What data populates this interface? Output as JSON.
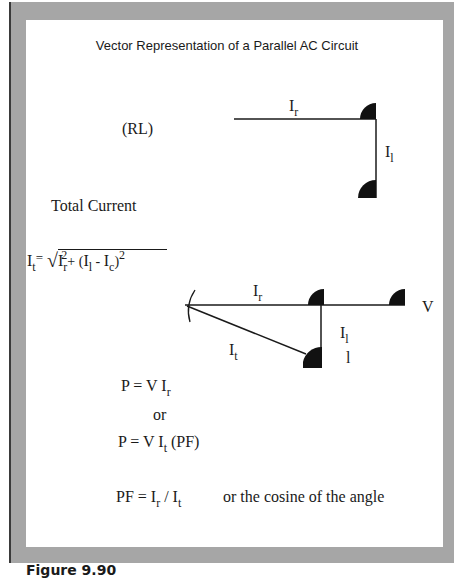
{
  "figure": {
    "title": "Vector Representation of a Parallel AC Circuit",
    "caption": "Figure 9.90"
  },
  "rl_diagram": {
    "label": "(RL)",
    "vectors": [
      {
        "name": "Ir",
        "label_main": "I",
        "label_sub": "r",
        "direction": "horizontal"
      },
      {
        "name": "Il",
        "label_main": "I",
        "label_sub": "l",
        "direction": "vertical-down"
      }
    ]
  },
  "total_current": {
    "heading": "Total Current",
    "formula": {
      "lhs_main": "I",
      "lhs_sub": "t",
      "equals": "=",
      "radical": "√",
      "term1_main": "I",
      "term1_sub": "r",
      "term1_sup": "2",
      "plus": "+ (",
      "term2_main": "I",
      "term2_sub": "l",
      "minus": " - ",
      "term3_main": "I",
      "term3_sub": "c",
      "close": ")",
      "close_sup": "2"
    }
  },
  "phasor_diagram": {
    "ir_main": "I",
    "ir_sub": "r",
    "it_main": "I",
    "it_sub": "t",
    "il_main": "I",
    "il_sub": "l",
    "il_extra": "l",
    "v_label": "V"
  },
  "power": {
    "eq1": {
      "lhs": "P = V ",
      "main": "I",
      "sub": "r"
    },
    "or": "or",
    "eq2": {
      "lhs": "P = V ",
      "main": "I",
      "sub": "t",
      "suffix": " (PF)"
    },
    "pf": {
      "lhs": "PF = ",
      "main1": "I",
      "sub1": "r",
      "slash": " / ",
      "main2": "I",
      "sub2": "t",
      "note": "or the cosine of the angle"
    }
  }
}
